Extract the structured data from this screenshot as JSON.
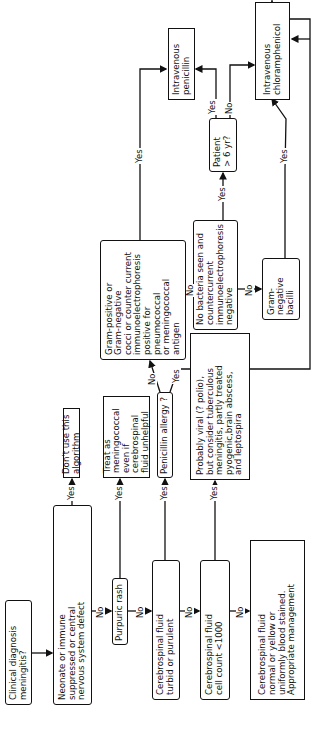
{
  "nodes": {
    "clinical_diagnosis": "Clinical diagnosis\nmeningitis?",
    "neonate": "Neonate or immune\nsuppressed or central\nnervous system defect",
    "dont_use": "Don't use this algorithm",
    "purpuric_rash": "Purpuric rash",
    "treat_meningococcal": "Treat as meningococcal\neven if cerebrospinal\nfluid unhelpful",
    "csf_turbid": "Cerebrospinal fluid\nturbid or purulent",
    "penicillin_allergy": "Penicillin allergy ?",
    "csf_cell_count": "Cerebrospinal fluid\ncell count <1000",
    "probably_viral": "Probably viral (? polio),\nbut consider tuberculous\nmeningitis, partly treated\npyogenic,brain abscess,\nand leptospira",
    "csf_normal": "Cerebrospinal fluid\nnormal or yellow or\nuniformly blood stained.\nAppropriate management",
    "gram_positive": "Gram-positive or\nGram-negative\ncocci or counter current\nimmunoelectrophoresis\npositive for pneumococcal\nor meningococcal antigen",
    "no_bacteria": "No bacteria seen and\ncountercurrent\nimmunoelectrophoresis\nnegative",
    "gram_negative_bacilli": "Gram-negative\nbacilli",
    "patient_age": "Patient\n> 6 yr?",
    "iv_penicillin": "Intravenous\npenicillin",
    "iv_chloramphenicol": "Intravenous\nchloramphenicol"
  },
  "edge_labels": {
    "yes": "Yes",
    "no": "No"
  },
  "colors": {
    "ink": "#111111",
    "background": "#ffffff"
  }
}
